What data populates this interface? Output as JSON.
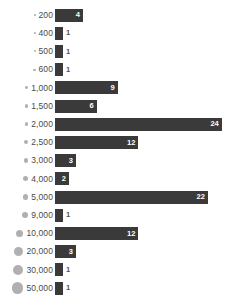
{
  "chart_data": {
    "type": "bar",
    "orientation": "horizontal",
    "title": "",
    "subtitle": "",
    "xlabel": "",
    "ylabel": "",
    "grid": false,
    "legend": "none",
    "xlim": [
      0,
      24
    ],
    "categories": [
      "200",
      "400",
      "500",
      "600",
      "1,000",
      "1,500",
      "2,000",
      "2,500",
      "3,000",
      "4,000",
      "5,000",
      "9,000",
      "10,000",
      "20,000",
      "30,000",
      "50,000"
    ],
    "values": [
      4,
      1,
      1,
      1,
      9,
      6,
      24,
      12,
      3,
      2,
      22,
      1,
      12,
      3,
      1,
      1
    ],
    "bubble_sizes_px": [
      1.6,
      1.8,
      2.0,
      2.2,
      2.8,
      3.2,
      3.6,
      4.0,
      4.4,
      5.0,
      5.6,
      6.6,
      7.4,
      9.0,
      10.2,
      11.4
    ],
    "bar_color": "#3a3a3a",
    "bubble_color": "#b0b0b0",
    "label_color": "#4a4a4a",
    "value_label_inside_color": "#ffffff",
    "value_label_outside_color": "#555555",
    "rows": [
      {
        "category": "200",
        "value": 4,
        "value_label": "4",
        "bubble_px": 1.6,
        "inside": true
      },
      {
        "category": "400",
        "value": 1,
        "value_label": "1",
        "bubble_px": 1.8,
        "inside": false
      },
      {
        "category": "500",
        "value": 1,
        "value_label": "1",
        "bubble_px": 2.0,
        "inside": false
      },
      {
        "category": "600",
        "value": 1,
        "value_label": "1",
        "bubble_px": 2.2,
        "inside": false
      },
      {
        "category": "1,000",
        "value": 9,
        "value_label": "9",
        "bubble_px": 2.8,
        "inside": true
      },
      {
        "category": "1,500",
        "value": 6,
        "value_label": "6",
        "bubble_px": 3.2,
        "inside": true
      },
      {
        "category": "2,000",
        "value": 24,
        "value_label": "24",
        "bubble_px": 3.6,
        "inside": true
      },
      {
        "category": "2,500",
        "value": 12,
        "value_label": "12",
        "bubble_px": 4.0,
        "inside": true
      },
      {
        "category": "3,000",
        "value": 3,
        "value_label": "3",
        "bubble_px": 4.4,
        "inside": true
      },
      {
        "category": "4,000",
        "value": 2,
        "value_label": "2",
        "bubble_px": 5.0,
        "inside": true
      },
      {
        "category": "5,000",
        "value": 22,
        "value_label": "22",
        "bubble_px": 5.6,
        "inside": true
      },
      {
        "category": "9,000",
        "value": 1,
        "value_label": "1",
        "bubble_px": 6.6,
        "inside": false
      },
      {
        "category": "10,000",
        "value": 12,
        "value_label": "12",
        "bubble_px": 7.4,
        "inside": true
      },
      {
        "category": "20,000",
        "value": 3,
        "value_label": "3",
        "bubble_px": 9.0,
        "inside": true
      },
      {
        "category": "30,000",
        "value": 1,
        "value_label": "1",
        "bubble_px": 10.2,
        "inside": false
      },
      {
        "category": "50,000",
        "value": 1,
        "value_label": "1",
        "bubble_px": 11.4,
        "inside": false
      }
    ]
  }
}
